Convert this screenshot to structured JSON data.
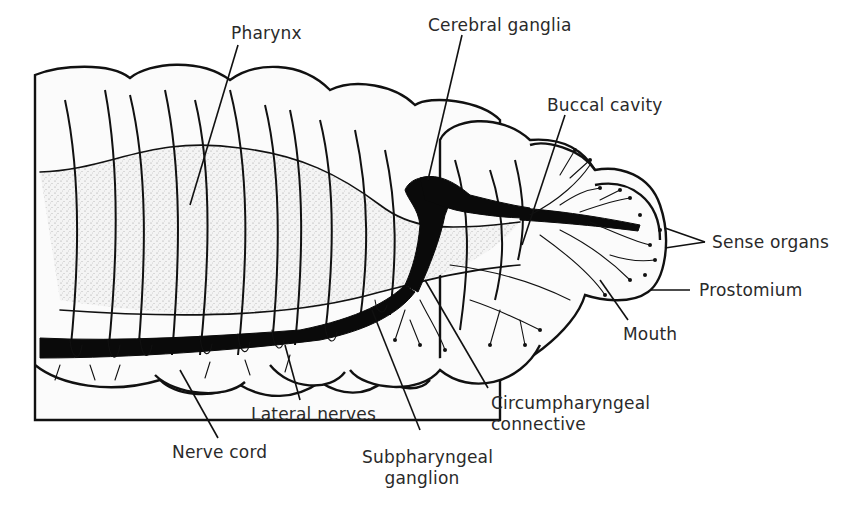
{
  "figure": {
    "labels": {
      "pharynx": "Pharynx",
      "cerebral_ganglia": "Cerebral ganglia",
      "buccal_cavity": "Buccal cavity",
      "sense_organs": "Sense organs",
      "prostomium": "Prostomium",
      "mouth": "Mouth",
      "circumpharyngeal_line1": "Circumpharyngeal",
      "circumpharyngeal_line2": "connective",
      "subpharyngeal_line1": "Subpharyngeal",
      "subpharyngeal_line2": "ganglion",
      "lateral_nerves": "Lateral nerves",
      "nerve_cord": "Nerve cord"
    },
    "colors": {
      "ink": "#111111",
      "label_text": "#2a2a2a",
      "stipple": "#9a9a9a",
      "background": "#ffffff"
    }
  }
}
